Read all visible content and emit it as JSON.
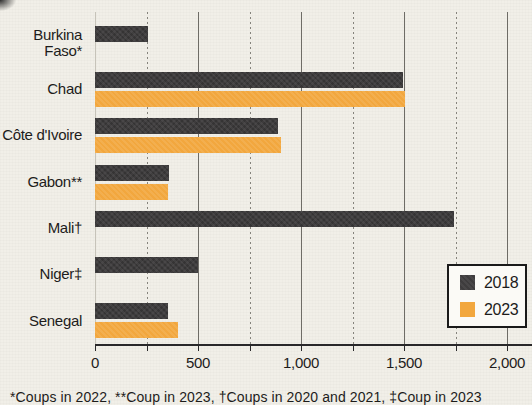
{
  "chart_data": {
    "type": "bar",
    "orientation": "horizontal",
    "title": "",
    "xlabel": "",
    "ylabel": "",
    "xlim": [
      0,
      2000
    ],
    "grid": "vertical",
    "legend_position": "bottom-right",
    "categories": [
      "Burkina\nFaso*",
      "Chad",
      "Côte d'Ivoire",
      "Gabon**",
      "Mali†",
      "Niger‡",
      "Senegal"
    ],
    "series": [
      {
        "name": "2018",
        "color": "#3e3c3d",
        "values": [
          255,
          1495,
          890,
          358,
          1743,
          500,
          355
        ]
      },
      {
        "name": "2023",
        "color": "#f2a73e",
        "values": [
          null,
          1505,
          905,
          352,
          null,
          null,
          403
        ]
      }
    ],
    "xticks": [
      {
        "value": 0,
        "label": "0"
      },
      {
        "value": 500,
        "label": "500"
      },
      {
        "value": 1000,
        "label": "1,000"
      },
      {
        "value": 1500,
        "label": "1,500"
      },
      {
        "value": 2000,
        "label": "2,000"
      }
    ],
    "major_gridlines": [
      500,
      1000,
      1500,
      2000
    ],
    "minor_gridlines": [
      250,
      750,
      1250,
      1750
    ]
  },
  "legend": {
    "items": [
      {
        "label": "2018",
        "color": "#3e3c3d"
      },
      {
        "label": "2023",
        "color": "#f2a73e"
      }
    ]
  },
  "footnote": "*Coups in 2022, **Coup in 2023, †Coups in 2020 and 2021, ‡Coup in 2023",
  "colors": {
    "background": "#f1efe8",
    "bar_2018": "#3e3c3d",
    "bar_2023": "#f2a73e",
    "axis": "#29282a",
    "text": "#1d1c1b"
  }
}
